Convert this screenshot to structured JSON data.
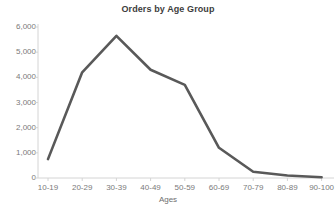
{
  "chart_data": {
    "type": "line",
    "title": "Orders by Age Group",
    "xlabel": "Ages",
    "ylabel": "",
    "categories": [
      "10-19",
      "20-29",
      "30-39",
      "40-49",
      "50-59",
      "60-69",
      "70-79",
      "80-89",
      "90-100"
    ],
    "values": [
      750,
      4200,
      5650,
      4300,
      3700,
      1200,
      250,
      100,
      30
    ],
    "ylim": [
      0,
      6000
    ],
    "y_ticks": [
      0,
      1000,
      2000,
      3000,
      4000,
      5000,
      6000
    ],
    "y_tick_labels": [
      "0",
      "1,000",
      "2,000",
      "3,000",
      "4,000",
      "5,000",
      "6,000"
    ],
    "grid": false,
    "legend": null,
    "series": [
      {
        "name": "Orders",
        "values": [
          750,
          4200,
          5650,
          4300,
          3700,
          1200,
          250,
          100,
          30
        ],
        "color": "#595959"
      }
    ],
    "line_color": "#595959",
    "axis_color": "#d4d4d4",
    "tick_text_color": "#7a7a7a",
    "title_color": "#3d3d3d"
  },
  "axis_title_text": "Ages"
}
